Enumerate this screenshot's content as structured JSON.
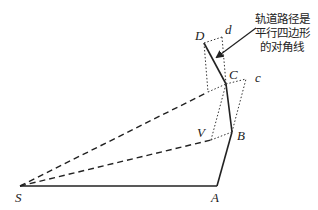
{
  "diagram": {
    "annotation": {
      "lines": [
        "轨道路径是",
        "平行四边形",
        "的对角线"
      ]
    },
    "points": {
      "S": {
        "label": "S",
        "x": 20,
        "y": 186
      },
      "A": {
        "label": "A",
        "x": 217,
        "y": 186
      },
      "B": {
        "label": "B",
        "x": 232,
        "y": 132
      },
      "C": {
        "label": "C",
        "x": 226,
        "y": 84
      },
      "D": {
        "label": "D",
        "x": 204,
        "y": 43
      },
      "V": {
        "label": "V",
        "x": 211,
        "y": 140
      },
      "c": {
        "label": "c",
        "x": 246,
        "y": 79
      },
      "d": {
        "label": "d",
        "x": 222,
        "y": 37
      }
    },
    "colors": {
      "stroke": "#222222",
      "background": "#ffffff"
    }
  }
}
